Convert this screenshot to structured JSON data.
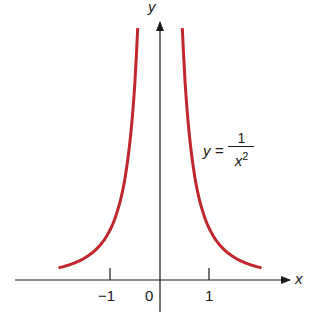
{
  "chart_data": {
    "type": "line",
    "title": "",
    "equation": {
      "lhs": "y =",
      "numerator": "1",
      "denominator_base": "x",
      "denominator_exp": "2"
    },
    "xlabel": "x",
    "ylabel": "y",
    "x_ticks": [
      {
        "value": -1,
        "label": "−1"
      },
      {
        "value": 0,
        "label": "0"
      },
      {
        "value": 1,
        "label": "1"
      }
    ],
    "series": [
      {
        "name": "y = 1/x^2 (x<0)",
        "color": "#c0272d",
        "x": [
          -2.05,
          -1.75,
          -1.5,
          -1.25,
          -1.0,
          -0.85,
          -0.7,
          -0.6,
          -0.5,
          -0.45
        ],
        "y": [
          0.238,
          0.327,
          0.444,
          0.64,
          1.0,
          1.384,
          2.041,
          2.778,
          4.0,
          4.938
        ]
      },
      {
        "name": "y = 1/x^2 (x>0)",
        "color": "#c0272d",
        "x": [
          0.45,
          0.5,
          0.6,
          0.7,
          0.85,
          1.0,
          1.25,
          1.5,
          1.75,
          2.05
        ],
        "y": [
          4.938,
          4.0,
          2.778,
          2.041,
          1.384,
          1.0,
          0.64,
          0.444,
          0.327,
          0.238
        ]
      }
    ],
    "xlim": [
      -2.9,
      2.6
    ],
    "ylim": [
      -0.55,
      4.8
    ],
    "grid": false,
    "legend": "none"
  },
  "labels": {
    "x_axis": "x",
    "y_axis": "y",
    "tick_neg1": "−1",
    "tick_0": "0",
    "tick_1": "1",
    "eq_lhs": "y =",
    "eq_num": "1",
    "eq_den": "x",
    "eq_exp": "2"
  },
  "colors": {
    "curve": "#c0272d",
    "axis": "#1a1a1a"
  }
}
